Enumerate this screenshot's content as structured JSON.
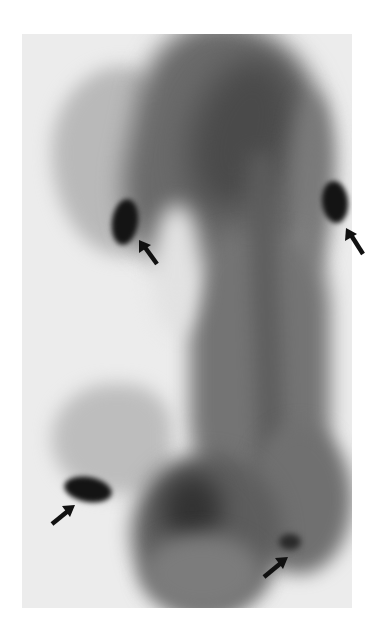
{
  "image": {
    "description": "Grayscale whole-mount embryo stain with four arrows marking dark spots",
    "background_color": "#ffffff",
    "frame_color": "#ececec",
    "tissue_tones": {
      "light": "#b9b9b9",
      "mid": "#707070",
      "dark": "#4a4a4a",
      "spot": "#141414"
    }
  },
  "markers": [
    {
      "id": "spot-upper-left",
      "arrow_tip": [
        139,
        240
      ],
      "arrow_tail": [
        157,
        264
      ],
      "direction": "up-left"
    },
    {
      "id": "spot-upper-right",
      "arrow_tip": [
        346,
        228
      ],
      "arrow_tail": [
        363,
        254
      ],
      "direction": "up-left"
    },
    {
      "id": "spot-lower-left",
      "arrow_tip": [
        75,
        505
      ],
      "arrow_tail": [
        52,
        524
      ],
      "direction": "up-right"
    },
    {
      "id": "spot-lower-right",
      "arrow_tip": [
        288,
        557
      ],
      "arrow_tail": [
        264,
        577
      ],
      "direction": "up-right"
    }
  ],
  "arrow_color": "#111111"
}
